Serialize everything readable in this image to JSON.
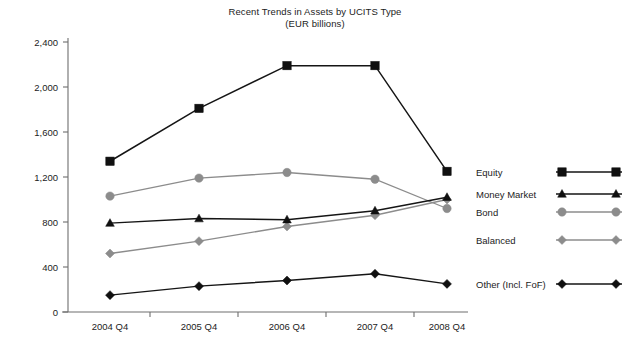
{
  "chart_data": {
    "type": "line",
    "title": "Recent Trends in Assets by UCITS Type",
    "subtitle": "(EUR billions)",
    "xlabel": "",
    "ylabel": "",
    "categories": [
      "2004 Q4",
      "2005 Q4",
      "2006 Q4",
      "2007 Q4",
      "2008 Q4"
    ],
    "ylim": [
      0,
      2400
    ],
    "yticks": [
      0,
      400,
      800,
      1200,
      1600,
      2000,
      2400
    ],
    "ytick_labels": [
      "0",
      "400",
      "800",
      "1,200",
      "1,600",
      "2,000",
      "2,400"
    ],
    "grid": false,
    "legend_position": "right",
    "series": [
      {
        "name": "Equity",
        "values": [
          1340,
          1810,
          2190,
          2190,
          1250
        ],
        "color": "#151515",
        "marker": "square",
        "marker_color": "#101010"
      },
      {
        "name": "Money Market",
        "values": [
          790,
          830,
          820,
          900,
          1020
        ],
        "color": "#151515",
        "marker": "triangle",
        "marker_color": "#101010"
      },
      {
        "name": "Bond",
        "values": [
          1030,
          1190,
          1240,
          1180,
          920
        ],
        "color": "#8c8c8c",
        "marker": "circle",
        "marker_color": "#8c8c8c"
      },
      {
        "name": "Balanced",
        "values": [
          520,
          630,
          760,
          860,
          1000
        ],
        "color": "#8c8c8c",
        "marker": "diamond",
        "marker_color": "#8c8c8c"
      },
      {
        "name": "Other (Incl. FoF)",
        "values": [
          150,
          230,
          280,
          340,
          250
        ],
        "color": "#151515",
        "marker": "diamond",
        "marker_color": "#101010"
      }
    ]
  },
  "axis": {
    "line_color": "#6e6e6e",
    "tick_color": "#6e6e6e"
  }
}
